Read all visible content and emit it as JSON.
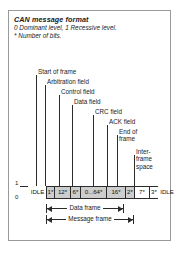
{
  "figure": {
    "title": "CAN message format",
    "note_levels": "0 Dominant level, 1 Recessive level.",
    "note_bits": "* Number of bits."
  },
  "axis": {
    "level_high": "1",
    "level_low": "0"
  },
  "callouts": [
    {
      "label": "Start of frame"
    },
    {
      "label": "Arbitration field"
    },
    {
      "label": "Control field"
    },
    {
      "label": "Data field"
    },
    {
      "label": "CRC field"
    },
    {
      "label": "ACK field"
    },
    {
      "label": "End of frame"
    },
    {
      "label": "Inter-frame space"
    }
  ],
  "fields": [
    {
      "name": "idle-left",
      "text": "IDLE",
      "shaded": false,
      "bordered": false
    },
    {
      "name": "start-of-frame",
      "text": "1*",
      "shaded": true,
      "bordered": true
    },
    {
      "name": "arbitration-field",
      "text": "12*",
      "shaded": true,
      "bordered": true
    },
    {
      "name": "control-field",
      "text": "6*",
      "shaded": true,
      "bordered": true
    },
    {
      "name": "data-field",
      "text": "0...64*",
      "shaded": true,
      "bordered": true
    },
    {
      "name": "crc-field",
      "text": "16*",
      "shaded": true,
      "bordered": true
    },
    {
      "name": "ack-field",
      "text": "2*",
      "shaded": true,
      "bordered": true
    },
    {
      "name": "end-of-frame",
      "text": "7*",
      "shaded": false,
      "bordered": true
    },
    {
      "name": "inter-frame-space",
      "text": "3*",
      "shaded": false,
      "bordered": true
    },
    {
      "name": "idle-right",
      "text": "IDLE",
      "shaded": false,
      "bordered": false
    }
  ],
  "spans": [
    {
      "name": "data-frame",
      "label": "Data frame"
    },
    {
      "name": "message-frame",
      "label": "Message frame"
    }
  ],
  "colors": {
    "shade": "#cdcdcd",
    "line": "#2b2b2b",
    "border": "#9a9a9a"
  }
}
